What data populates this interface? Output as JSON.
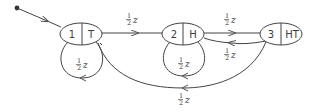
{
  "diagram": {
    "type": "state-transition-graph",
    "start": {
      "x": 17,
      "y": 8
    },
    "nodes": [
      {
        "id": "1",
        "number": "1",
        "label": "T",
        "cx": 81,
        "cy": 34,
        "rx": 21,
        "ry": 11
      },
      {
        "id": "2",
        "number": "2",
        "label": "H",
        "cx": 183,
        "cy": 34,
        "rx": 21,
        "ry": 11
      },
      {
        "id": "3",
        "number": "3",
        "label": "HT",
        "cx": 281,
        "cy": 34,
        "rx": 21,
        "ry": 11
      }
    ],
    "edges": [
      {
        "from": "start",
        "to": "1",
        "label": ""
      },
      {
        "from": "1",
        "to": "2",
        "label_num": "1",
        "label_den": "2",
        "label_var": "z"
      },
      {
        "from": "2",
        "to": "3",
        "label_num": "1",
        "label_den": "2",
        "label_var": "z"
      },
      {
        "from": "3",
        "to": "2",
        "label_num": "1",
        "label_den": "2",
        "label_var": "z"
      },
      {
        "from": "1",
        "to": "1",
        "label_num": "1",
        "label_den": "2",
        "label_var": "z"
      },
      {
        "from": "2",
        "to": "2",
        "label_num": "1",
        "label_den": "2",
        "label_var": "z"
      },
      {
        "from": "3",
        "to": "1",
        "label_num": "1",
        "label_den": "2",
        "label_var": "z"
      }
    ],
    "colors": {
      "stroke": "#444444",
      "text": "#3a3a3a",
      "background": "#ffffff"
    }
  }
}
